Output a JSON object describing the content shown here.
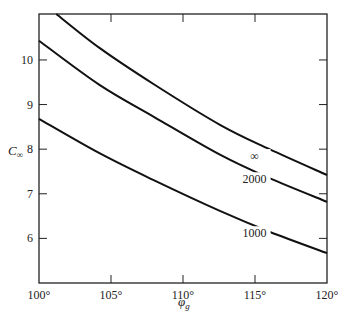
{
  "chart_data": {
    "type": "line",
    "title": "",
    "xlabel": "φ_g",
    "ylabel": "C∞",
    "xlim": [
      100,
      120
    ],
    "ylim": [
      5,
      11.03
    ],
    "grid": false,
    "legend": "inline curve labels",
    "x_ticks": [
      100,
      105,
      110,
      115,
      120
    ],
    "x_tick_labels": [
      "100°",
      "105°",
      "110°",
      "115°",
      "120°"
    ],
    "y_ticks": [
      6,
      7,
      8,
      9,
      10
    ],
    "y_tick_labels": [
      "6",
      "7",
      "8",
      "9",
      "10"
    ],
    "series": [
      {
        "name": "∞",
        "label": "∞",
        "label_at": [
          114.0,
          7.8
        ],
        "points": [
          [
            101.2,
            11.03
          ],
          [
            104.2,
            10.27
          ],
          [
            108,
            9.45
          ],
          [
            112.6,
            8.54
          ],
          [
            116,
            8.0
          ],
          [
            120,
            7.42
          ]
        ]
      },
      {
        "name": "2000",
        "label": "2000",
        "label_at": [
          114.0,
          7.28
        ],
        "points": [
          [
            100,
            10.43
          ],
          [
            104.2,
            9.44
          ],
          [
            108,
            8.72
          ],
          [
            112.6,
            7.87
          ],
          [
            116,
            7.35
          ],
          [
            120,
            6.82
          ]
        ]
      },
      {
        "name": "1000",
        "label": "1000",
        "label_at": [
          114.0,
          6.07
        ],
        "points": [
          [
            100,
            8.68
          ],
          [
            104.2,
            7.91
          ],
          [
            108,
            7.3
          ],
          [
            112.6,
            6.61
          ],
          [
            116,
            6.15
          ],
          [
            120,
            5.67
          ]
        ]
      }
    ]
  },
  "axes": {
    "x_title": "φ",
    "x_title_sub": "g",
    "y_title": "C",
    "y_title_sub": "∞"
  }
}
